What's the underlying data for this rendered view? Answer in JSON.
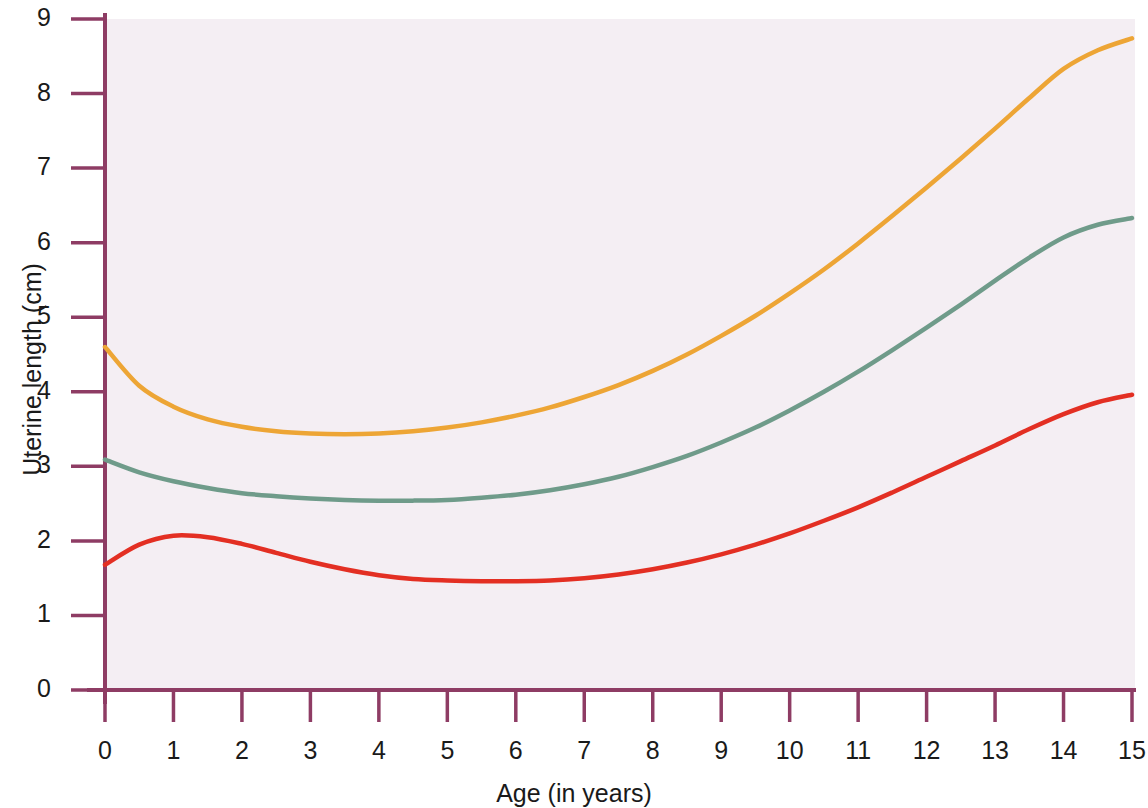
{
  "chart_data": {
    "type": "line",
    "title": "",
    "xlabel": "Age (in years)",
    "ylabel": "Uterine length (cm)",
    "xlim": [
      0,
      15
    ],
    "ylim": [
      0,
      9
    ],
    "xticks": [
      0,
      1,
      2,
      3,
      4,
      5,
      6,
      7,
      8,
      9,
      10,
      11,
      12,
      13,
      14,
      15
    ],
    "yticks": [
      0,
      1,
      2,
      3,
      4,
      5,
      6,
      7,
      8,
      9
    ],
    "xtick_labels": [
      "0",
      "1",
      "2",
      "3",
      "4",
      "5",
      "6",
      "7",
      "8",
      "9",
      "10",
      "11",
      "12",
      "13",
      "14",
      "15"
    ],
    "ytick_labels": [
      "0",
      "1",
      "2",
      "3",
      "4",
      "5",
      "6",
      "7",
      "8",
      "9"
    ],
    "grid": false,
    "legend": "none",
    "plot_background": "#f4eef3",
    "axis_color": "#8e3c64",
    "x": [
      0,
      0.5,
      1,
      1.5,
      2,
      2.5,
      3,
      3.5,
      4,
      4.5,
      5,
      5.5,
      6,
      6.5,
      7,
      7.5,
      8,
      8.5,
      9,
      9.5,
      10,
      10.5,
      11,
      11.5,
      12,
      12.5,
      13,
      13.5,
      14,
      14.5,
      15
    ],
    "series": [
      {
        "name": "upper-curve",
        "color": "#eda535",
        "values": [
          4.6,
          4.08,
          3.8,
          3.63,
          3.53,
          3.47,
          3.44,
          3.43,
          3.44,
          3.47,
          3.52,
          3.59,
          3.68,
          3.79,
          3.93,
          4.09,
          4.28,
          4.5,
          4.75,
          5.02,
          5.32,
          5.64,
          5.99,
          6.36,
          6.74,
          7.13,
          7.53,
          7.94,
          8.33,
          8.58,
          8.74
        ]
      },
      {
        "name": "middle-curve",
        "color": "#6f9b8a",
        "values": [
          3.09,
          2.92,
          2.8,
          2.71,
          2.64,
          2.6,
          2.57,
          2.55,
          2.54,
          2.54,
          2.55,
          2.58,
          2.62,
          2.68,
          2.76,
          2.86,
          2.99,
          3.14,
          3.32,
          3.52,
          3.75,
          4.0,
          4.27,
          4.56,
          4.86,
          5.17,
          5.49,
          5.8,
          6.07,
          6.24,
          6.33
        ]
      },
      {
        "name": "lower-curve",
        "color": "#e32f23",
        "values": [
          1.68,
          1.95,
          2.07,
          2.05,
          1.96,
          1.84,
          1.72,
          1.62,
          1.54,
          1.49,
          1.47,
          1.46,
          1.46,
          1.47,
          1.5,
          1.55,
          1.62,
          1.71,
          1.82,
          1.95,
          2.1,
          2.27,
          2.45,
          2.65,
          2.86,
          3.07,
          3.28,
          3.5,
          3.7,
          3.86,
          3.96
        ]
      }
    ]
  }
}
